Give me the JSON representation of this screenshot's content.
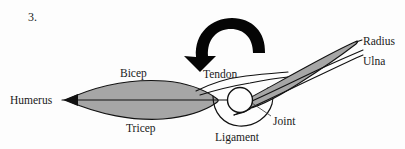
{
  "figure": {
    "item_number": "3.",
    "background_color": "#fdfdfd",
    "muscle_fill_color": "#a6a6a6",
    "outline_color": "#111111",
    "arrow_color": "#050505"
  },
  "labels": {
    "humerus": "Humerus",
    "bicep": "Bicep",
    "tricep": "Tricep",
    "tendon": "Tendon",
    "ligament": "Ligament",
    "joint": "Joint",
    "radius": "Radius",
    "ulna": "Ulna"
  },
  "parts": {
    "rotation_arrow": "curved-rotation-arrow-counterclockwise",
    "joint_marker": "open-circle-joint",
    "upper_arm_muscle": "bicep-tricep-spindle",
    "forearm_bone": "radius-tapered-shaft"
  }
}
